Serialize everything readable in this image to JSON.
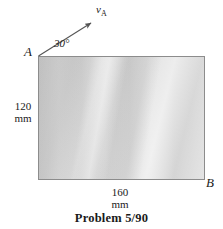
{
  "figure": {
    "caption": "Problem 5/90",
    "plate": {
      "corner_labels": {
        "top_left": "A",
        "bottom_right": "B"
      },
      "dimensions": {
        "height_value": "120",
        "height_unit": "mm",
        "width_value": "160",
        "width_unit": "mm"
      },
      "fill_color": "#d0d0d0",
      "border_color": "#8c8c8c"
    },
    "velocity_vector": {
      "symbol": "v",
      "subscript": "A",
      "angle_label": "30°",
      "color": "#555555"
    }
  }
}
